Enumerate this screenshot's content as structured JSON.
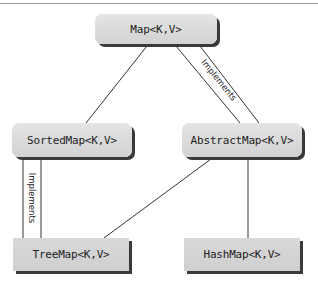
{
  "diagram": {
    "type": "class-hierarchy",
    "nodes": [
      {
        "id": "map",
        "label": "Map<K,V>",
        "kind": "interface"
      },
      {
        "id": "sortedmap",
        "label": "SortedMap<K,V>",
        "kind": "interface"
      },
      {
        "id": "abstractmap",
        "label": "AbstractMap<K,V>",
        "kind": "interface"
      },
      {
        "id": "treemap",
        "label": "TreeMap<K,V>",
        "kind": "class"
      },
      {
        "id": "hashmap",
        "label": "HashMap<K,V>",
        "kind": "class"
      }
    ],
    "edges": [
      {
        "from": "map",
        "to": "sortedmap",
        "label": ""
      },
      {
        "from": "map",
        "to": "abstractmap",
        "label": "Implements"
      },
      {
        "from": "sortedmap",
        "to": "treemap",
        "label": "Implements"
      },
      {
        "from": "abstractmap",
        "to": "treemap",
        "label": ""
      },
      {
        "from": "abstractmap",
        "to": "hashmap",
        "label": ""
      }
    ]
  }
}
